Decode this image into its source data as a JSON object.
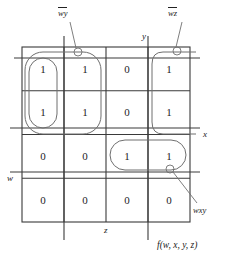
{
  "diagram": {
    "type": "karnaugh-map",
    "title_function": "f(w, x, y, z)",
    "grid": {
      "rows": 4,
      "cols": 4,
      "values": [
        [
          "1",
          "1",
          "0",
          "1"
        ],
        [
          "1",
          "1",
          "0",
          "1"
        ],
        [
          "0",
          "0",
          "1",
          "1"
        ],
        [
          "0",
          "0",
          "0",
          "0"
        ]
      ]
    },
    "axis_labels": {
      "top": "y",
      "right": "x",
      "left": "w",
      "bottom": "z"
    },
    "groups": [
      {
        "name": "group-wbar-ybar",
        "label_plain": "wy",
        "label_part1": "w",
        "label_part2": "y",
        "cells": "columns 1-2, rows 1-2"
      },
      {
        "name": "group-wbar-zbar",
        "label_plain": "wz",
        "label_part1": "w",
        "label_part2": "z",
        "cells": "column 4, rows 1-2 (wraparound)"
      },
      {
        "name": "group-wxy",
        "label_plain": "wxy",
        "cells": "columns 3-4, row 3"
      }
    ],
    "colors": {
      "grid_line": "#3a3a3a",
      "loop_line": "#6f6f6f",
      "text": "#1a1a1a"
    }
  }
}
